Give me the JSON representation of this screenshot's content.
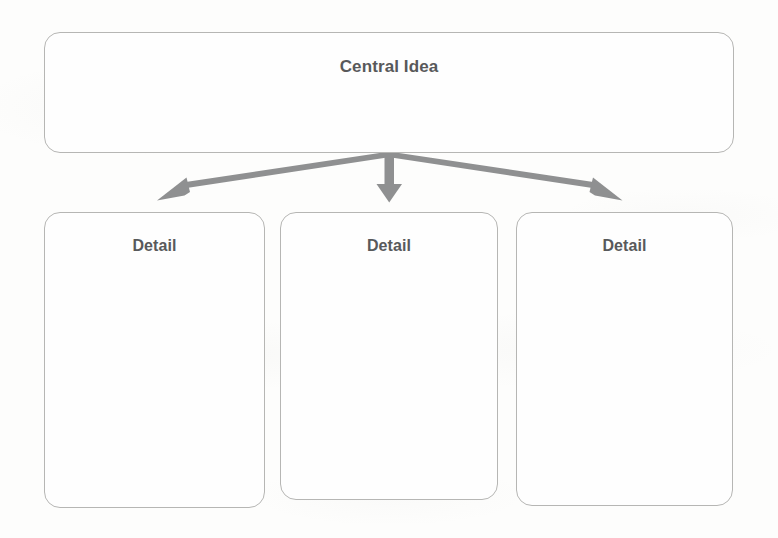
{
  "diagram": {
    "title_node": {
      "label": "Central Idea",
      "shape": "rounded-rectangle"
    },
    "detail_nodes": [
      {
        "label": "Detail"
      },
      {
        "label": "Detail"
      },
      {
        "label": "Detail"
      }
    ],
    "connectors": [
      {
        "name": "arrow-to-detail-1",
        "direction": "down-left"
      },
      {
        "name": "arrow-to-detail-2",
        "direction": "down"
      },
      {
        "name": "arrow-to-detail-3",
        "direction": "down-right"
      }
    ],
    "colors": {
      "background": "#fdfdfc",
      "box_fill": "#fefefe",
      "box_border": "#b6b6b4",
      "text": "#58595b",
      "arrow": "#8f9091"
    }
  }
}
